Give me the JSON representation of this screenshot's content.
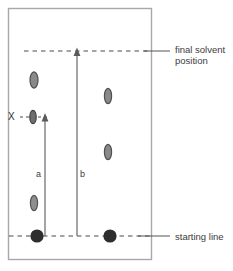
{
  "figure": {
    "type": "chromatography-diagram",
    "title": "",
    "plate": {
      "x": 8,
      "y": 8,
      "width": 144,
      "height": 252,
      "border_color": "#a8a8a8",
      "fill_color": "#ffffff"
    },
    "lines": [
      {
        "name": "final-solvent-front-line",
        "style": "dashed",
        "y": 51,
        "x_start": 24,
        "x_end": 150,
        "color": "#4a4a4a"
      },
      {
        "name": "starting-line",
        "style": "dashed",
        "y": 236,
        "x_start": 9,
        "x_end": 150,
        "color": "#4a4a4a"
      },
      {
        "name": "x-reference-line",
        "style": "dashed",
        "y": 117,
        "x_start": 20,
        "x_end": 48,
        "color": "#4a4a4a"
      }
    ],
    "arrows": [
      {
        "name": "distance-a-arrow",
        "label": "a",
        "x": 45,
        "y_from": 236,
        "y_to": 119,
        "label_x": 38,
        "label_y": 175,
        "color": "#5a5a5a",
        "meaning": "distance travelled by spot X"
      },
      {
        "name": "distance-b-arrow",
        "label": "b",
        "x": 77,
        "y_from": 236,
        "y_to": 53,
        "label_x": 80,
        "label_y": 175,
        "color": "#5a5a5a",
        "meaning": "distance travelled by solvent front"
      }
    ],
    "spots": [
      {
        "name": "spot-left-upper",
        "cx": 34,
        "cy": 80,
        "rx": 4,
        "ry": 8,
        "color": "#6e6e6e",
        "filled": false
      },
      {
        "name": "spot-x",
        "cx": 33,
        "cy": 117,
        "rx": 3.2,
        "ry": 6.5,
        "color": "#5e5e5e",
        "filled": false
      },
      {
        "name": "spot-left-lower",
        "cx": 34,
        "cy": 203,
        "rx": 3.6,
        "ry": 7.5,
        "color": "#7a7a7a",
        "filled": false
      },
      {
        "name": "spot-right-upper",
        "cx": 108,
        "cy": 96,
        "rx": 3.6,
        "ry": 7.5,
        "color": "#6e6e6e",
        "filled": false
      },
      {
        "name": "spot-right-lower",
        "cx": 108,
        "cy": 152,
        "rx": 3.6,
        "ry": 7.5,
        "color": "#6e6e6e",
        "filled": false
      }
    ],
    "origin_spots": [
      {
        "name": "origin-spot-sample",
        "cx": 37,
        "cy": 236,
        "r": 6.5,
        "color": "#2e2e2e"
      },
      {
        "name": "origin-spot-reference",
        "cx": 110,
        "cy": 236,
        "r": 6.5,
        "color": "#2e2e2e"
      }
    ],
    "leader_lines": [
      {
        "name": "final-solvent-leader",
        "x_start": 145,
        "x_end": 170,
        "y": 51,
        "color": "#555555"
      },
      {
        "name": "starting-line-leader",
        "x_start": 140,
        "x_end": 170,
        "y": 236,
        "color": "#555555"
      }
    ],
    "labels": {
      "x_marker": "X",
      "distance_a": "a",
      "distance_b": "b",
      "final_solvent_line1": "final solvent",
      "final_solvent_line2": "position",
      "starting_line": "starting line"
    },
    "colors": {
      "plate_border": "#a8a8a8",
      "dash_line": "#4a4a4a",
      "arrow": "#5a5a5a",
      "spot": "#6e6e6e",
      "origin_spot": "#2e2e2e",
      "text": "#3b3b3b",
      "background": "#ffffff"
    }
  }
}
